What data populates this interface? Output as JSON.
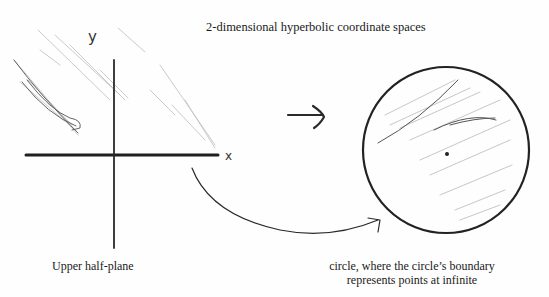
{
  "diagram": {
    "title": "2-dimensional hyperbolic coordinate spaces",
    "left_panel": {
      "name": "Upper half-plane",
      "y_axis_label": "y",
      "x_axis_label": "x",
      "caption": "Upper half-plane"
    },
    "transform_arrow": {
      "direction": "right"
    },
    "right_panel": {
      "name": "Poincaré disk",
      "caption_line1": "circle, where the circle’s boundary",
      "caption_line2": "represents points at infinite"
    },
    "connector": {
      "from": "x-axis boundary",
      "to": "circle boundary"
    },
    "colors": {
      "ink": "#1a1a1a",
      "pencil_shading": "#9a9a9a",
      "background": "#fefefe"
    }
  }
}
